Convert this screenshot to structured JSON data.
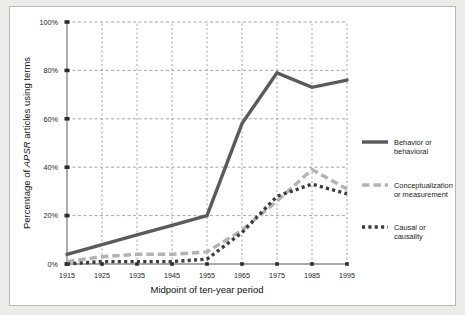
{
  "figure": {
    "background": "#edebe7",
    "panel_background": "#ffffff",
    "border_color": "#b9b7b3"
  },
  "axes": {
    "ylabel_parts": {
      "pre": "Percentage of ",
      "italic": "APSR",
      "post": " articles using terms"
    },
    "ylabel_full": "Percentage of APSR articles using terms",
    "xlabel": "Midpoint of ten-year period",
    "yticks": [
      "0%",
      "20%",
      "40%",
      "60%",
      "80%",
      "100%"
    ],
    "xticks": [
      "1915",
      "1925",
      "1935",
      "1945",
      "1955",
      "1965",
      "1975",
      "1985",
      "1995"
    ]
  },
  "legend": {
    "items": [
      {
        "label_line1": "Behavior or",
        "label_line2": "behavioral",
        "style": "solid",
        "color": "#5a5a5a"
      },
      {
        "label_line1": "Conceptualization",
        "label_line2": "or measurement",
        "style": "dashed",
        "color": "#b3b3b3"
      },
      {
        "label_line1": "Causal or",
        "label_line2": "causality",
        "style": "dotted",
        "color": "#3d3d3d"
      }
    ]
  },
  "chart_data": {
    "type": "line",
    "title": "",
    "xlabel": "Midpoint of ten-year period",
    "ylabel": "Percentage of APSR articles using terms",
    "categories": [
      1915,
      1925,
      1935,
      1945,
      1955,
      1965,
      1975,
      1985,
      1995
    ],
    "xlim": [
      1915,
      1995
    ],
    "ylim": [
      0,
      100
    ],
    "yticks": [
      0,
      20,
      40,
      60,
      80,
      100
    ],
    "grid": true,
    "grid_style": "dashed",
    "legend_position": "right-outside",
    "series": [
      {
        "name": "Behavior or behavioral",
        "color": "#5a5a5a",
        "style": "solid",
        "width": 3.4,
        "values": [
          4,
          8,
          12,
          16,
          20,
          58,
          79,
          73,
          76
        ]
      },
      {
        "name": "Conceptualization or measurement",
        "color": "#b3b3b3",
        "style": "dashed",
        "width": 3.4,
        "values": [
          1,
          3,
          4,
          4,
          5,
          14,
          26,
          39,
          31
        ]
      },
      {
        "name": "Causal or causality",
        "color": "#3d3d3d",
        "style": "dotted",
        "width": 3.4,
        "values": [
          0,
          1,
          1,
          1,
          2,
          13,
          28,
          33,
          29
        ]
      }
    ]
  }
}
